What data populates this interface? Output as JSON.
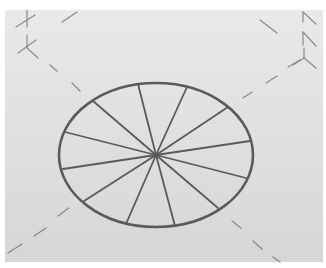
{
  "figure": {
    "background": {
      "x": 5,
      "y": 10,
      "width": 318,
      "height": 252,
      "color_top": "#e9e9e9",
      "color_bottom": "#d6d6d6"
    },
    "stroke_color": "#5a5a5a",
    "guide_color": "#8a8a8a"
  },
  "ellipse": {
    "cx": 156,
    "cy": 155,
    "rx": 97,
    "ry": 72,
    "stroke_width": 2.6
  },
  "spokes": [
    [
      138,
      84
    ],
    [
      187,
      87
    ],
    [
      228,
      107
    ],
    [
      250,
      141
    ],
    [
      246,
      178
    ],
    [
      218,
      208
    ],
    [
      175,
      226
    ],
    [
      126,
      224
    ],
    [
      84,
      201
    ],
    [
      63,
      169
    ],
    [
      65,
      132
    ],
    [
      93,
      101
    ]
  ],
  "guides": [
    {
      "name": "dash-top-left-1",
      "x1": 50,
      "y1": 65,
      "x2": 57,
      "y2": 71
    },
    {
      "name": "dash-top-left-2",
      "x1": 72,
      "y1": 83,
      "x2": 80,
      "y2": 91
    },
    {
      "name": "dash-top",
      "x1": 62,
      "y1": 22,
      "x2": 77,
      "y2": 12
    },
    {
      "name": "dash-top-right-1",
      "x1": 260,
      "y1": 20,
      "x2": 277,
      "y2": 33
    },
    {
      "name": "dash-upper-right-1",
      "x1": 243,
      "y1": 98,
      "x2": 252,
      "y2": 92
    },
    {
      "name": "dash-upper-right-2",
      "x1": 266,
      "y1": 83,
      "x2": 277,
      "y2": 76
    },
    {
      "name": "dash-upper-right-3",
      "x1": 288,
      "y1": 67,
      "x2": 300,
      "y2": 60
    },
    {
      "name": "dash-bottom-left-1",
      "x1": 58,
      "y1": 216,
      "x2": 69,
      "y2": 208
    },
    {
      "name": "dash-bottom-left-2",
      "x1": 34,
      "y1": 236,
      "x2": 46,
      "y2": 228
    },
    {
      "name": "dash-bottom-left-3",
      "x1": 8,
      "y1": 253,
      "x2": 22,
      "y2": 244
    },
    {
      "name": "dash-bottom-right-1",
      "x1": 232,
      "y1": 221,
      "x2": 241,
      "y2": 228
    },
    {
      "name": "dash-bottom-right-2",
      "x1": 253,
      "y1": 241,
      "x2": 262,
      "y2": 249
    },
    {
      "name": "dash-bottom-right-3",
      "x1": 273,
      "y1": 257,
      "x2": 280,
      "y2": 262
    }
  ],
  "marks": [
    {
      "name": "axis-mark-top-left-1",
      "lines": [
        [
          27,
          10,
          27,
          27
        ],
        [
          16,
          27,
          35,
          15
        ]
      ]
    },
    {
      "name": "axis-mark-top-left-2",
      "lines": [
        [
          27,
          35,
          27,
          48
        ],
        [
          18,
          53,
          36,
          40
        ],
        [
          27,
          48,
          38,
          58
        ]
      ]
    },
    {
      "name": "axis-mark-top-right-1",
      "lines": [
        [
          303,
          12,
          303,
          22
        ],
        [
          303,
          12,
          316,
          24
        ]
      ]
    },
    {
      "name": "axis-mark-top-right-2",
      "lines": [
        [
          303,
          32,
          303,
          45
        ],
        [
          303,
          32,
          316,
          46
        ]
      ]
    },
    {
      "name": "axis-mark-top-right-3",
      "lines": [
        [
          304,
          48,
          304,
          58
        ],
        [
          293,
          65,
          304,
          58
        ],
        [
          304,
          58,
          316,
          68
        ]
      ]
    }
  ]
}
